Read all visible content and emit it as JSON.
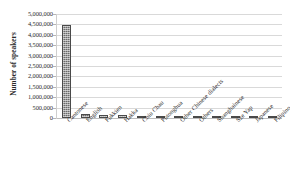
{
  "chart_data": {
    "type": "bar",
    "title": "",
    "xlabel": "",
    "ylabel": "Number of speakers",
    "ylim": [
      0,
      5000000
    ],
    "ytick_step": 500000,
    "grid": true,
    "legend": "none",
    "bar_color": "#6b6b6b",
    "categories": [
      "Cantonese",
      "English",
      "Fukkien",
      "Hakka",
      "Chiu Chau",
      "Putonghua",
      "Other Chinese dialects",
      "Others",
      "Shanghainese",
      "Sze Yap",
      "Japanese",
      "Filipino"
    ],
    "values": [
      4450000,
      190000,
      160000,
      125000,
      105000,
      85000,
      70000,
      55000,
      42000,
      30000,
      22000,
      18000
    ],
    "ytick_labels": [
      "5,000,000",
      "4,500,000",
      "4,000,000",
      "3,500,000",
      "3,000,000",
      "2,500,000",
      "2,000,000",
      "1,500,000",
      "1,000,000",
      "500,000",
      "0"
    ]
  }
}
